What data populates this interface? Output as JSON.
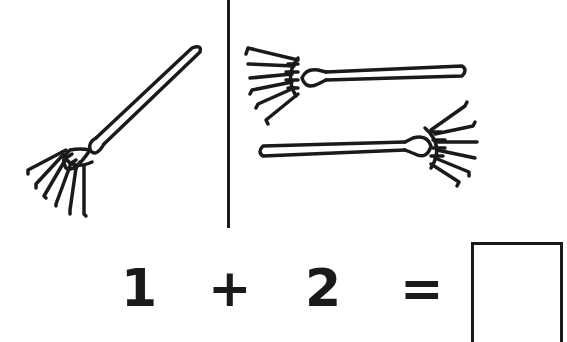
{
  "left_panel": {
    "rake_count": 1,
    "description": "one rake, diagonal"
  },
  "right_panel": {
    "rake_count": 2,
    "description": "two rakes, horizontal"
  },
  "equation": {
    "left_operand": "1",
    "operator": "+",
    "right_operand": "2",
    "equals": "=",
    "answer": ""
  },
  "colors": {
    "ink": "#1a1a1a",
    "background": "#ffffff"
  }
}
